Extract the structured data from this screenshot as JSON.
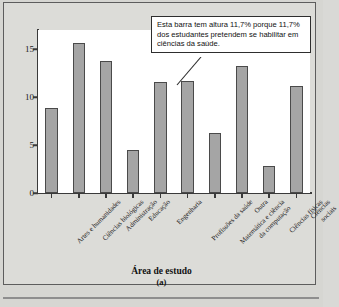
{
  "figure": {
    "panel_letter": "(a)",
    "callout_text": "Esta barra tem altura 11,7% porque 11,7% dos estudantes pretendem se habilitar em ciências da saúde.",
    "background_color": "#d6d6d2",
    "bar_fill_color": "#a5a5a5",
    "bar_edge_color": "#4a4a4a",
    "plot_background_color": "#ffffff"
  },
  "chart_data": {
    "type": "bar",
    "title": "",
    "xlabel": "Área de estudo",
    "ylabel": "Percentual de estudantes que planejam se habilitar",
    "categories": [
      "Artes e humanidades",
      "Ciências biológicas",
      "Administração",
      "Educação",
      "Engenharia",
      "Profissões da saúde",
      "Matemática e ciência\nda computação",
      "Outra",
      "Ciências físicas",
      "Ciências sociais"
    ],
    "values": [
      8.9,
      15.6,
      13.8,
      4.5,
      11.6,
      11.7,
      6.3,
      13.2,
      2.8,
      11.2
    ],
    "ylim": [
      0,
      17
    ],
    "yticks": [
      0,
      5,
      10,
      15
    ],
    "ytick_labels": [
      "0",
      "5",
      "10",
      "15"
    ],
    "grid": false,
    "legend": null,
    "annotations": [
      {
        "target_category": "Profissões da saúde",
        "target_value": 11.7,
        "text": "Esta barra tem altura 11,7% porque 11,7% dos estudantes pretendem se habilitar em ciências da saúde."
      }
    ]
  }
}
